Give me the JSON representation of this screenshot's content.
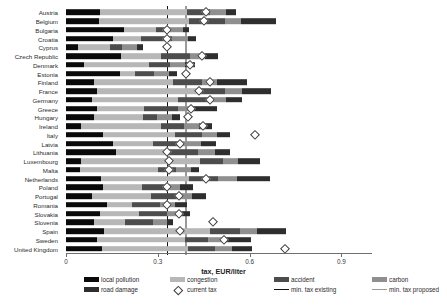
{
  "axis": {
    "title": "tax, EUR/liter",
    "ticks": [
      0,
      0.3,
      0.6,
      0.9
    ],
    "tick_labels": [
      "0",
      "0.3",
      "0.6",
      "0.9"
    ],
    "xlim": [
      0,
      1.0
    ]
  },
  "reference_lines": {
    "min_tax_existing": 0.33,
    "min_tax_proposed": 0.39
  },
  "legend": {
    "items": [
      {
        "label": "local pollution",
        "key": "local",
        "swatch": "block",
        "color": "#0a0a0a"
      },
      {
        "label": "congestion",
        "key": "congestion",
        "swatch": "block",
        "color": "#b7b7b7"
      },
      {
        "label": "accident",
        "key": "accident",
        "swatch": "block",
        "color": "#4d4d4d"
      },
      {
        "label": "carbon",
        "key": "carbon",
        "swatch": "block",
        "color": "#8f8f8f"
      },
      {
        "label": "road damage",
        "key": "roaddamage",
        "swatch": "block",
        "color": "#2e2e2e"
      },
      {
        "label": "current tax",
        "key": "current_tax",
        "swatch": "diamond",
        "color": "#3a3a3a"
      },
      {
        "label": "min. tax existing",
        "key": "line_existing",
        "swatch": "line",
        "color": "#111111"
      },
      {
        "label": "min. tax proposed",
        "key": "line_proposed",
        "swatch": "line",
        "color": "#9a9a9a"
      }
    ]
  },
  "chart_data": {
    "type": "bar",
    "orientation": "horizontal",
    "stacked": true,
    "title": "",
    "xlabel": "tax, EUR/liter",
    "ylabel": "",
    "xlim": [
      0,
      1.0
    ],
    "grid": false,
    "legend_position": "bottom",
    "series_order": [
      "local pollution",
      "congestion",
      "accident",
      "carbon",
      "road damage"
    ],
    "series_colors": {
      "local pollution": "#0a0a0a",
      "congestion": "#b7b7b7",
      "accident": "#4d4d4d",
      "carbon": "#8f8f8f",
      "road damage": "#2e2e2e"
    },
    "categories": [
      "Austria",
      "Belgium",
      "Bulgaria",
      "Croatia",
      "Cyprus",
      "Czech Republic",
      "Denmark",
      "Estonia",
      "Finland",
      "France",
      "Germany",
      "Greece",
      "Hungary",
      "Ireland",
      "Italy",
      "Latvia",
      "Lithuania",
      "Luxembourg",
      "Malta",
      "Netherlands",
      "Poland",
      "Portugal",
      "Romania",
      "Slovakia",
      "Slovenia",
      "Spain",
      "Sweden",
      "United Kingdom"
    ],
    "rows": [
      {
        "country": "Austria",
        "local_pollution": 0.112,
        "congestion": 0.283,
        "accident": 0.077,
        "carbon": 0.05,
        "road_damage": 0.035,
        "current_tax": 0.457,
        "total": 0.557
      },
      {
        "country": "Belgium",
        "local_pollution": 0.108,
        "congestion": 0.295,
        "accident": 0.115,
        "carbon": 0.055,
        "road_damage": 0.112,
        "current_tax": 0.452,
        "total": 0.685
      },
      {
        "country": "Bulgaria",
        "local_pollution": 0.19,
        "congestion": 0.105,
        "accident": 0.04,
        "carbon": 0.048,
        "road_damage": 0.02,
        "current_tax": 0.33,
        "total": 0.403
      },
      {
        "country": "Croatia",
        "local_pollution": 0.153,
        "congestion": 0.093,
        "accident": 0.1,
        "carbon": 0.052,
        "road_damage": 0.028,
        "current_tax": 0.33,
        "total": 0.426
      },
      {
        "country": "Cyprus",
        "local_pollution": 0.04,
        "congestion": 0.103,
        "accident": 0.04,
        "carbon": 0.05,
        "road_damage": 0.02,
        "current_tax": 0.33,
        "total": 0.253
      },
      {
        "country": "Czech Republic",
        "local_pollution": 0.18,
        "congestion": 0.13,
        "accident": 0.095,
        "carbon": 0.048,
        "road_damage": 0.045,
        "current_tax": 0.443,
        "total": 0.498
      },
      {
        "country": "Denmark",
        "local_pollution": 0.06,
        "congestion": 0.21,
        "accident": 0.07,
        "carbon": 0.05,
        "road_damage": 0.03,
        "current_tax": 0.405,
        "total": 0.42
      },
      {
        "country": "Estonia",
        "local_pollution": 0.175,
        "congestion": 0.052,
        "accident": 0.06,
        "carbon": 0.05,
        "road_damage": 0.025,
        "current_tax": 0.393,
        "total": 0.362
      },
      {
        "country": "Finland",
        "local_pollution": 0.09,
        "congestion": 0.26,
        "accident": 0.095,
        "carbon": 0.05,
        "road_damage": 0.095,
        "current_tax": 0.47,
        "total": 0.59
      },
      {
        "country": "France",
        "local_pollution": 0.1,
        "congestion": 0.33,
        "accident": 0.09,
        "carbon": 0.055,
        "road_damage": 0.095,
        "current_tax": 0.435,
        "total": 0.67
      },
      {
        "country": "Germany",
        "local_pollution": 0.086,
        "congestion": 0.28,
        "accident": 0.108,
        "carbon": 0.05,
        "road_damage": 0.05,
        "current_tax": 0.47,
        "total": 0.574
      },
      {
        "country": "Greece",
        "local_pollution": 0.1,
        "congestion": 0.155,
        "accident": 0.11,
        "carbon": 0.05,
        "road_damage": 0.078,
        "current_tax": 0.41,
        "total": 0.493
      },
      {
        "country": "Hungary",
        "local_pollution": 0.093,
        "congestion": 0.16,
        "accident": 0.045,
        "carbon": 0.05,
        "road_damage": 0.025,
        "current_tax": 0.4,
        "total": 0.373
      },
      {
        "country": "Ireland",
        "local_pollution": 0.05,
        "congestion": 0.26,
        "accident": 0.075,
        "carbon": 0.05,
        "road_damage": 0.042,
        "current_tax": 0.449,
        "total": 0.477
      },
      {
        "country": "Italy",
        "local_pollution": 0.12,
        "congestion": 0.235,
        "accident": 0.09,
        "carbon": 0.05,
        "road_damage": 0.04,
        "current_tax": 0.617,
        "total": 0.535
      },
      {
        "country": "Latvia",
        "local_pollution": 0.155,
        "congestion": 0.13,
        "accident": 0.095,
        "carbon": 0.06,
        "road_damage": 0.05,
        "current_tax": 0.372,
        "total": 0.49
      },
      {
        "country": "Lithuania",
        "local_pollution": 0.162,
        "congestion": 0.16,
        "accident": 0.11,
        "carbon": 0.055,
        "road_damage": 0.05,
        "current_tax": 0.33,
        "total": 0.537
      },
      {
        "country": "Luxembourg",
        "local_pollution": 0.048,
        "congestion": 0.39,
        "accident": 0.075,
        "carbon": 0.05,
        "road_damage": 0.072,
        "current_tax": 0.335,
        "total": 0.635
      },
      {
        "country": "Malta",
        "local_pollution": 0.045,
        "congestion": 0.255,
        "accident": 0.06,
        "carbon": 0.05,
        "road_damage": 0.025,
        "current_tax": 0.337,
        "total": 0.435
      },
      {
        "country": "Netherlands",
        "local_pollution": 0.113,
        "congestion": 0.29,
        "accident": 0.095,
        "carbon": 0.06,
        "road_damage": 0.11,
        "current_tax": 0.457,
        "total": 0.668
      },
      {
        "country": "Poland",
        "local_pollution": 0.122,
        "congestion": 0.127,
        "accident": 0.075,
        "carbon": 0.05,
        "road_damage": 0.04,
        "current_tax": 0.33,
        "total": 0.414
      },
      {
        "country": "Portugal",
        "local_pollution": 0.085,
        "congestion": 0.193,
        "accident": 0.085,
        "carbon": 0.05,
        "road_damage": 0.045,
        "current_tax": 0.368,
        "total": 0.458
      },
      {
        "country": "Romania",
        "local_pollution": 0.135,
        "congestion": 0.082,
        "accident": 0.09,
        "carbon": 0.05,
        "road_damage": 0.04,
        "current_tax": 0.33,
        "total": 0.397
      },
      {
        "country": "Slovakia",
        "local_pollution": 0.11,
        "congestion": 0.13,
        "accident": 0.09,
        "carbon": 0.05,
        "road_damage": 0.025,
        "current_tax": 0.368,
        "total": 0.405
      },
      {
        "country": "Slovenia",
        "local_pollution": 0.09,
        "congestion": 0.103,
        "accident": 0.09,
        "carbon": 0.048,
        "road_damage": 0.02,
        "current_tax": 0.48,
        "total": 0.351
      },
      {
        "country": "Spain",
        "local_pollution": 0.125,
        "congestion": 0.345,
        "accident": 0.1,
        "carbon": 0.055,
        "road_damage": 0.095,
        "current_tax": 0.371,
        "total": 0.72
      },
      {
        "country": "Sweden",
        "local_pollution": 0.1,
        "congestion": 0.29,
        "accident": 0.075,
        "carbon": 0.055,
        "road_damage": 0.085,
        "current_tax": 0.517,
        "total": 0.605
      },
      {
        "country": "United Kingdom",
        "local_pollution": 0.118,
        "congestion": 0.28,
        "accident": 0.09,
        "carbon": 0.055,
        "road_damage": 0.065,
        "current_tax": 0.715,
        "total": 0.608
      }
    ]
  }
}
